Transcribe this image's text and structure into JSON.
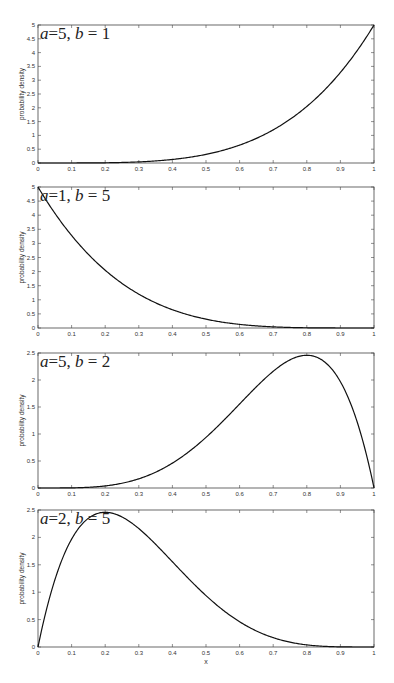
{
  "chart_data": [
    {
      "type": "line",
      "title": "",
      "annotation": {
        "a_label": "a",
        "a_value": "5",
        "b_label": "b",
        "b_value": "1"
      },
      "xlabel": "",
      "ylabel": "probability density",
      "xlim": [
        0,
        1
      ],
      "ylim": [
        0,
        5
      ],
      "xticks": [
        "0",
        "0.1",
        "0.2",
        "0.3",
        "0.4",
        "0.5",
        "0.6",
        "0.7",
        "0.8",
        "0.9",
        "1"
      ],
      "yticks": [
        "0",
        "0.5",
        "1",
        "1.5",
        "2",
        "2.5",
        "3",
        "3.5",
        "4",
        "4.5",
        "5"
      ],
      "grid": false,
      "series": [
        {
          "name": "Beta(5,1)",
          "x": [
            0,
            0.1,
            0.2,
            0.3,
            0.4,
            0.5,
            0.6,
            0.7,
            0.8,
            0.9,
            1.0
          ],
          "values": [
            0,
            0.0005,
            0.008,
            0.0405,
            0.128,
            0.3125,
            0.648,
            1.2005,
            2.048,
            3.2805,
            5.0
          ]
        }
      ]
    },
    {
      "type": "line",
      "title": "",
      "annotation": {
        "a_label": "a",
        "a_value": "1",
        "b_label": "b",
        "b_value": "5"
      },
      "xlabel": "",
      "ylabel": "probability density",
      "xlim": [
        0,
        1
      ],
      "ylim": [
        0,
        5
      ],
      "xticks": [
        "0",
        "0.1",
        "0.2",
        "0.3",
        "0.4",
        "0.5",
        "0.6",
        "0.7",
        "0.8",
        "0.9",
        "1"
      ],
      "yticks": [
        "0",
        "0.5",
        "1",
        "1.5",
        "2",
        "2.5",
        "3",
        "3.5",
        "4",
        "4.5",
        "5"
      ],
      "grid": false,
      "series": [
        {
          "name": "Beta(1,5)",
          "x": [
            0,
            0.1,
            0.2,
            0.3,
            0.4,
            0.5,
            0.6,
            0.7,
            0.8,
            0.9,
            1.0
          ],
          "values": [
            5.0,
            3.2805,
            2.048,
            1.2005,
            0.648,
            0.3125,
            0.128,
            0.0405,
            0.008,
            0.0005,
            0
          ]
        }
      ]
    },
    {
      "type": "line",
      "title": "",
      "annotation": {
        "a_label": "a",
        "a_value": "5",
        "b_label": "b",
        "b_value": "2"
      },
      "xlabel": "",
      "ylabel": "probability density",
      "xlim": [
        0,
        1
      ],
      "ylim": [
        0,
        2.5
      ],
      "xticks": [
        "0",
        "0.1",
        "0.2",
        "0.3",
        "0.4",
        "0.5",
        "0.6",
        "0.7",
        "0.8",
        "0.9",
        "1"
      ],
      "yticks": [
        "0",
        "0.5",
        "1",
        "1.5",
        "2",
        "2.5"
      ],
      "grid": false,
      "series": [
        {
          "name": "Beta(5,2)",
          "x": [
            0,
            0.1,
            0.2,
            0.3,
            0.4,
            0.5,
            0.6,
            0.7,
            0.8,
            0.9,
            1.0
          ],
          "values": [
            0,
            0.0027,
            0.0384,
            0.1701,
            0.4608,
            0.9375,
            1.5552,
            2.1609,
            2.4576,
            1.9683,
            0
          ]
        }
      ]
    },
    {
      "type": "line",
      "title": "",
      "annotation": {
        "a_label": "a",
        "a_value": "2",
        "b_label": "b",
        "b_value": "5"
      },
      "xlabel": "x",
      "ylabel": "probability density",
      "xlim": [
        0,
        1
      ],
      "ylim": [
        0,
        2.5
      ],
      "xticks": [
        "0",
        "0.1",
        "0.2",
        "0.3",
        "0.4",
        "0.5",
        "0.6",
        "0.7",
        "0.8",
        "0.9",
        "1"
      ],
      "yticks": [
        "0",
        "0.5",
        "1",
        "1.5",
        "2",
        "2.5"
      ],
      "grid": false,
      "series": [
        {
          "name": "Beta(2,5)",
          "x": [
            0,
            0.1,
            0.2,
            0.3,
            0.4,
            0.5,
            0.6,
            0.7,
            0.8,
            0.9,
            1.0
          ],
          "values": [
            0,
            1.9683,
            2.4576,
            2.1609,
            1.5552,
            0.9375,
            0.4608,
            0.1701,
            0.0384,
            0.0027,
            0
          ]
        }
      ]
    }
  ]
}
